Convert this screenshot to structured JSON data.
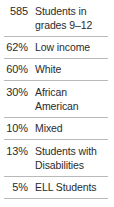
{
  "table": {
    "rows": [
      {
        "value": "585",
        "label": "Students in grades 9–12"
      },
      {
        "value": "62%",
        "label": "Low income"
      },
      {
        "value": "60%",
        "label": "White"
      },
      {
        "value": "30%",
        "label": "African American"
      },
      {
        "value": "10%",
        "label": "Mixed"
      },
      {
        "value": "13%",
        "label": "Students with Disabilities"
      },
      {
        "value": "5%",
        "label": "ELL Students"
      }
    ],
    "rule_color": "#b9b9b9",
    "text_color": "#2b2b2b",
    "background_color": "#ffffff"
  }
}
